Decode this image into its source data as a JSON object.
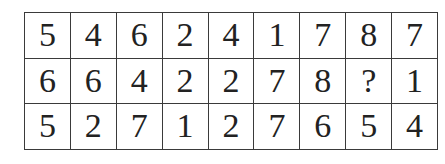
{
  "grid": {
    "rows": [
      [
        "5",
        "4",
        "6",
        "2",
        "4",
        "1",
        "7",
        "8",
        "7"
      ],
      [
        "6",
        "6",
        "4",
        "2",
        "2",
        "7",
        "8",
        "?",
        "1"
      ],
      [
        "5",
        "2",
        "7",
        "1",
        "2",
        "7",
        "6",
        "5",
        "4"
      ]
    ]
  }
}
